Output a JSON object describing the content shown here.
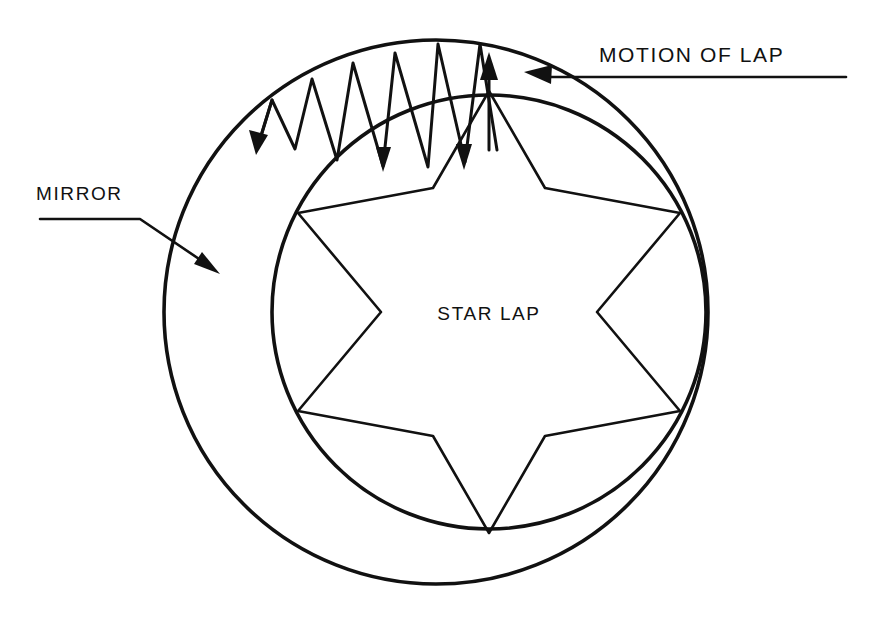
{
  "figure": {
    "kind": "technical-line-diagram",
    "background_color": "#ffffff",
    "ink_color": "#111111",
    "width": 881,
    "height": 624
  },
  "labels": {
    "mirror": "MIRROR",
    "motion_of_lap": "MOTION OF LAP",
    "star_lap": "STAR LAP"
  },
  "annotations": {
    "mirror_leader": {
      "label_ref": "MIRROR",
      "points_to": "outer-mirror-ring",
      "arrow_direction": "down-right"
    },
    "motion_leader": {
      "label_ref": "MOTION OF LAP",
      "points_to": "outer-mirror-ring-upper-right",
      "arrow_direction": "left"
    }
  },
  "geometry": {
    "outer_ring": {
      "cx": 436,
      "cy": 312,
      "r": 272,
      "name": "mirror"
    },
    "inner_ring": {
      "cx": 489,
      "cy": 312,
      "r": 217,
      "name": "lap-bore"
    },
    "star": {
      "cx": 489,
      "cy": 312,
      "outer_r": 221,
      "inner_r": 112,
      "points": 6,
      "rotation_deg": -60
    },
    "zigzag": {
      "teeth": 7,
      "start_angle_deg": 198,
      "end_angle_deg": 268,
      "description": "abrasive stroke path between mirror and lap"
    }
  },
  "arrows": {
    "down_left_stroke": {
      "direction": "down-left",
      "meaning": "lap stroke"
    },
    "down_stroke_a": {
      "direction": "down",
      "meaning": "lap stroke"
    },
    "down_stroke_b": {
      "direction": "down",
      "meaning": "lap stroke"
    },
    "up_stroke": {
      "direction": "up",
      "meaning": "lap stroke return"
    }
  }
}
